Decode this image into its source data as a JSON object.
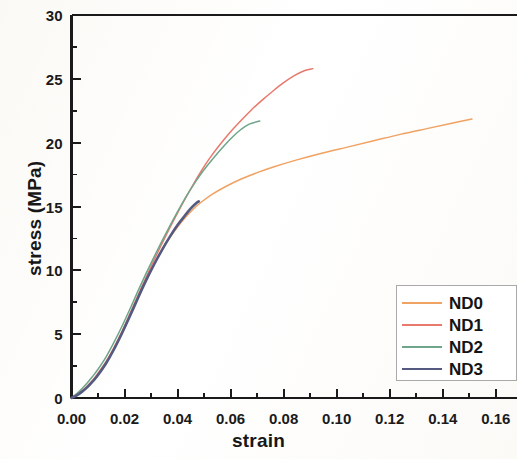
{
  "chart_data": {
    "type": "line",
    "title": "",
    "xlabel": "strain",
    "ylabel": "stress (MPa)",
    "xlim": [
      0.0,
      0.168
    ],
    "ylim": [
      0,
      30
    ],
    "xticks": [
      "0.00",
      "0.02",
      "0.04",
      "0.06",
      "0.08",
      "0.10",
      "0.12",
      "0.14",
      "0.16"
    ],
    "xtick_values": [
      0.0,
      0.02,
      0.04,
      0.06,
      0.08,
      0.1,
      0.12,
      0.14,
      0.16
    ],
    "yticks": [
      "0",
      "5",
      "10",
      "15",
      "20",
      "25",
      "30"
    ],
    "ytick_values": [
      0,
      5,
      10,
      15,
      20,
      25,
      30
    ],
    "xminor_step": 0.01,
    "yminor_step": 2.5,
    "grid": false,
    "legend_position": "lower right",
    "series": [
      {
        "name": "ND0",
        "color": "#F0A263",
        "width": 1.5,
        "x": [
          0.0,
          0.002,
          0.004,
          0.006,
          0.008,
          0.01,
          0.013,
          0.016,
          0.019,
          0.022,
          0.025,
          0.028,
          0.031,
          0.034,
          0.037,
          0.04,
          0.043,
          0.046,
          0.049,
          0.053,
          0.058,
          0.064,
          0.07,
          0.077,
          0.085,
          0.094,
          0.104,
          0.114,
          0.124,
          0.134,
          0.143,
          0.151
        ],
        "y": [
          0.0,
          0.25,
          0.55,
          0.9,
          1.35,
          1.85,
          2.75,
          3.85,
          5.1,
          6.45,
          7.85,
          9.2,
          10.45,
          11.55,
          12.55,
          13.4,
          14.15,
          14.8,
          15.35,
          15.95,
          16.55,
          17.15,
          17.65,
          18.15,
          18.65,
          19.15,
          19.65,
          20.15,
          20.65,
          21.1,
          21.5,
          21.85
        ]
      },
      {
        "name": "ND1",
        "color": "#E8796C",
        "width": 1.5,
        "x": [
          0.0,
          0.002,
          0.004,
          0.006,
          0.008,
          0.01,
          0.013,
          0.016,
          0.019,
          0.022,
          0.025,
          0.028,
          0.031,
          0.034,
          0.037,
          0.04,
          0.043,
          0.046,
          0.049,
          0.052,
          0.056,
          0.06,
          0.064,
          0.068,
          0.072,
          0.076,
          0.08,
          0.084,
          0.088,
          0.091
        ],
        "y": [
          0.0,
          0.25,
          0.55,
          0.95,
          1.4,
          1.95,
          2.85,
          3.95,
          5.2,
          6.6,
          8.0,
          9.4,
          10.75,
          12.05,
          13.3,
          14.5,
          15.65,
          16.75,
          17.8,
          18.75,
          19.85,
          20.85,
          21.75,
          22.6,
          23.35,
          24.05,
          24.7,
          25.25,
          25.65,
          25.8
        ]
      },
      {
        "name": "ND2",
        "color": "#6FA58B",
        "width": 1.5,
        "x": [
          0.0,
          0.002,
          0.004,
          0.006,
          0.008,
          0.01,
          0.013,
          0.016,
          0.019,
          0.022,
          0.025,
          0.028,
          0.031,
          0.034,
          0.037,
          0.04,
          0.043,
          0.046,
          0.049,
          0.052,
          0.055,
          0.058,
          0.061,
          0.064,
          0.067,
          0.071
        ],
        "y": [
          0.0,
          0.35,
          0.75,
          1.2,
          1.7,
          2.25,
          3.2,
          4.35,
          5.6,
          6.95,
          8.35,
          9.7,
          11.0,
          12.25,
          13.45,
          14.6,
          15.7,
          16.7,
          17.6,
          18.4,
          19.15,
          19.85,
          20.5,
          21.05,
          21.45,
          21.7
        ]
      },
      {
        "name": "ND3",
        "color": "#545A80",
        "width": 2.6,
        "x": [
          0.0,
          0.002,
          0.004,
          0.006,
          0.008,
          0.01,
          0.013,
          0.016,
          0.019,
          0.022,
          0.025,
          0.028,
          0.031,
          0.034,
          0.037,
          0.04,
          0.043,
          0.045,
          0.047,
          0.048
        ],
        "y": [
          0.0,
          0.2,
          0.5,
          0.85,
          1.3,
          1.8,
          2.7,
          3.8,
          5.05,
          6.4,
          7.8,
          9.15,
          10.4,
          11.55,
          12.6,
          13.55,
          14.35,
          14.85,
          15.25,
          15.4
        ]
      }
    ]
  },
  "legend": {
    "entries": [
      {
        "label": "ND0"
      },
      {
        "label": "ND1"
      },
      {
        "label": "ND2"
      },
      {
        "label": "ND3"
      }
    ]
  },
  "axes": {
    "x_title": "strain",
    "y_title": "stress (MPa)"
  },
  "colors": {
    "axis": "#1a1a1a",
    "legend_border": "#a9a9a9",
    "background": "#fdfdfb"
  }
}
